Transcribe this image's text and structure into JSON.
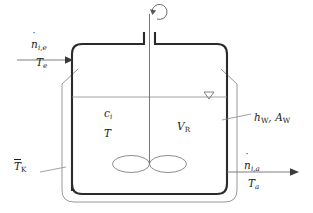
{
  "figure": {
    "name": "stirred-tank-reactor-schematic",
    "type": "process-flow-diagram",
    "background_color": "#ffffff",
    "line_color_vessel": "#2b2b2b",
    "line_color_jacket": "#8c8c8c",
    "line_color_thin": "#8a8a8a",
    "text_color": "#1c1c1c"
  },
  "labels": {
    "inlet_molar_flow": {
      "symbol": "n",
      "accent": "dot",
      "subscript": "i,e",
      "meaning": "inlet-molar-flow-rate"
    },
    "inlet_temperature": {
      "symbol": "T",
      "subscript": "e",
      "meaning": "inlet-temperature"
    },
    "outlet_molar_flow": {
      "symbol": "n",
      "accent": "dot",
      "subscript": "i,a",
      "meaning": "outlet-molar-flow-rate"
    },
    "outlet_temperature": {
      "symbol": "T",
      "subscript": "a",
      "meaning": "outlet-temperature"
    },
    "wall_heat_transfer": {
      "text": "hW, AW",
      "symbol_1": "h",
      "subscript_1": "W",
      "separator": ", ",
      "symbol_2": "A",
      "subscript_2": "W",
      "meaning": "wall-heat-transfer-coefficient-and-area"
    },
    "jacket_temperature": {
      "symbol": "T",
      "accent": "bar",
      "subscript": "K",
      "meaning": "mean-jacket-coolant-temperature"
    },
    "concentration": {
      "symbol": "c",
      "subscript": "i",
      "meaning": "species-concentration-in-reactor"
    },
    "reactor_temperature": {
      "symbol": "T",
      "meaning": "reactor-temperature"
    },
    "reactor_volume": {
      "symbol": "V",
      "subscript": "R",
      "meaning": "reactor-volume"
    }
  },
  "elements": {
    "vessel": "reactor-vessel",
    "jacket": "cooling-jacket",
    "stirrer_shaft": "stirrer-shaft",
    "impeller": "impeller-blades",
    "rotation_arrow": "rotation-arrow",
    "liquid_level": "liquid-level-line",
    "level_marker": "level-triangle-marker",
    "inlet_arrow": "inlet-stream-arrow",
    "outlet_arrow": "outlet-stream-arrow"
  }
}
